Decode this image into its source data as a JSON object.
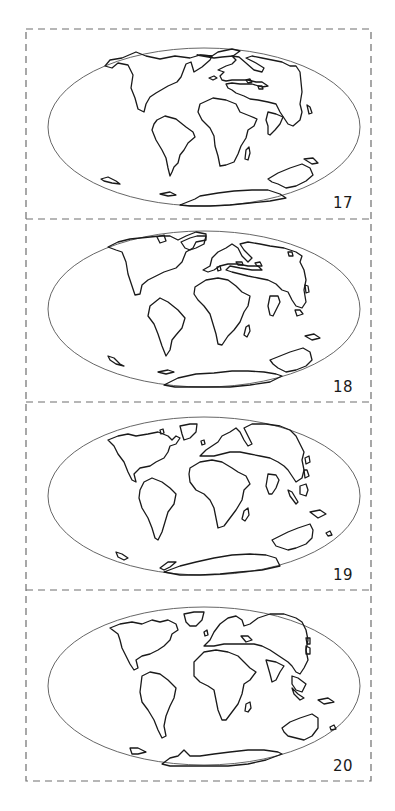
{
  "figure": {
    "stroke_color": "#1a1a1a",
    "frame_color": "#6e6e6e",
    "ellipse_color": "#555555",
    "frame": {
      "x": 26,
      "y": 29,
      "w": 345,
      "h": 752
    },
    "dividers_y": [
      219,
      402,
      590
    ]
  },
  "panels": [
    {
      "label": "17",
      "label_pos": {
        "x": 333,
        "y": 196
      },
      "ellipse": {
        "cx": 204,
        "cy": 127,
        "rx": 156,
        "ry": 79
      },
      "dy": 0,
      "continents": [
        {
          "name": "north-america",
          "d": "M105,66 L112,68 L118,63 L128,65 L133,75 L131,88 L135,98 L138,109 L144,112 L146,104 L150,97 L156,93 L168,86 L177,82 L181,77 L186,64 L191,62 L194,72 L202,67 L210,60 L212,56 L200,55 L190,58 L175,56 L160,59 L146,56 L136,52 L122,58 L110,60 Z"
        },
        {
          "name": "greenland",
          "d": "M197,55 L212,56 L218,52 L232,49 L240,51 L233,56 L222,57 L214,58 Z"
        },
        {
          "name": "south-america",
          "d": "M157,120 L165,116 L176,119 L186,127 L193,132 L195,137 L188,143 L184,150 L180,155 L178,163 L174,167 L172,172 L170,176 L168,168 L166,158 L162,150 L156,140 L152,130 L154,124 Z"
        },
        {
          "name": "africa",
          "d": "M200,104 L213,98 L226,100 L236,104 L240,112 L250,116 L257,119 L254,126 L248,130 L246,138 L241,146 L238,154 L234,162 L226,165 L220,166 L218,156 L215,146 L214,136 L210,128 L206,124 L202,120 L198,112 Z"
        },
        {
          "name": "madagascar",
          "d": "M246,150 L249,147 L250,153 L248,160 L245,159 Z"
        },
        {
          "name": "eurasia",
          "d": "M218,70 L226,66 L232,64 L236,60 L232,56 L239,57 L246,63 L254,70 L262,72 L264,68 L256,63 L246,58 L252,56 L262,58 L272,60 L282,62 L290,66 L296,66 L300,72 L301,82 L302,92 L300,104 L302,112 L300,120 L293,126 L288,124 L284,118 L280,112 L276,104 L268,102 L258,100 L250,99 L244,96 L236,93 L232,90 L228,88 L226,84 L232,83 L240,84 L252,84 L262,87 L268,86 L262,82 L256,82 L248,80 L240,80 L232,80 L226,81 L222,80 L220,76 L224,72 Z"
        },
        {
          "name": "india",
          "d": "M268,112 L276,114 L283,117 L280,124 L275,130 L270,135 L268,134 L268,126 L266,120 Z"
        },
        {
          "name": "small-island-1",
          "d": "M246,80 L250,79 L252,82 L248,83 Z"
        },
        {
          "name": "small-island-2",
          "d": "M258,86 L262,86 L263,89 L259,89 Z"
        },
        {
          "name": "small-island-3",
          "d": "M209,78 L214,76 L217,78 L213,80 Z"
        },
        {
          "name": "japan",
          "d": "M307,105 L310,107 L312,113 L309,114 Z"
        },
        {
          "name": "australia",
          "d": "M268,179 L278,173 L290,168 L302,164 L310,168 L313,175 L306,181 L296,186 L286,188 L278,184 L272,182 Z"
        },
        {
          "name": "new-zealand",
          "d": "M304,159 L313,158 L318,163 L312,164 Z"
        },
        {
          "name": "antarctic-piece-1",
          "d": "M101,179 L108,177 L116,181 L120,184 L112,183 L104,181 Z"
        },
        {
          "name": "antarctic-piece-2",
          "d": "M160,194 L170,192 L176,195 L168,196 Z"
        },
        {
          "name": "antarctica",
          "d": "M180,205 L195,199 L200,196 L218,193 L234,191 L252,190 L268,190 L280,194 L286,198 L270,201 L250,203 L230,205 L210,206 L190,206 Z"
        }
      ]
    },
    {
      "label": "18",
      "label_pos": {
        "x": 333,
        "y": 380
      },
      "ellipse": {
        "cx": 204,
        "cy": 309,
        "rx": 156,
        "ry": 78
      },
      "dy": 0,
      "continents": [
        {
          "name": "north-america",
          "d": "M108,247 L116,250 L122,252 L126,262 L128,274 L131,283 L135,295 L140,294 L142,285 L148,280 L156,276 L164,272 L176,268 L182,262 L186,252 L193,248 L196,242 L206,240 L206,234 L196,232 L186,236 L178,240 L170,236 L160,236 L150,237 L140,238 L130,239 L118,242 Z"
        },
        {
          "name": "greenland",
          "d": "M181,242 L190,238 L197,236 L206,236 L204,244 L196,248 L190,250 L185,248 Z"
        },
        {
          "name": "greenland-ice",
          "d": "M157,237 L164,235 L166,241 L160,243 Z"
        },
        {
          "name": "south-america",
          "d": "M150,306 L160,298 L168,302 L178,310 L185,318 L182,328 L176,335 L172,340 L170,350 L166,356 L162,346 L158,334 L154,324 L148,316 Z"
        },
        {
          "name": "africa",
          "d": "M195,287 L206,280 L218,278 L228,280 L236,286 L242,292 L250,296 L248,306 L244,312 L240,322 L234,330 L228,336 L222,345 L218,344 L216,334 L213,324 L210,314 L204,306 L198,300 L194,294 Z"
        },
        {
          "name": "madagascar",
          "d": "M246,327 L249,325 L250,331 L247,337 L244,335 Z"
        },
        {
          "name": "eurasia",
          "d": "M203,270 L210,266 L212,258 L218,252 L226,248 L232,244 L238,248 L242,256 L248,262 L252,258 L244,250 L240,244 L248,242 L260,244 L270,246 L284,248 L296,252 L302,256 L300,262 L304,270 L306,280 L304,290 L306,302 L302,308 L296,306 L292,300 L288,292 L282,290 L276,284 L268,280 L258,278 L248,276 L240,274 L232,272 L226,270 L230,266 L240,268 L252,270 L262,270 L258,266 L248,266 L238,264 L228,264 L220,266 L214,270 L208,272 Z"
        },
        {
          "name": "india",
          "d": "M270,296 L278,296 L280,302 L276,310 L273,316 L270,315 L268,306 Z"
        },
        {
          "name": "japan",
          "d": "M305,285 L308,286 L309,292 L306,293 Z"
        },
        {
          "name": "se-asia-island",
          "d": "M295,310 L300,310 L303,314 L297,316 Z"
        },
        {
          "name": "small-island-1",
          "d": "M217,267 L220,266 L221,270 L218,271 Z"
        },
        {
          "name": "small-island-2",
          "d": "M255,263 L260,262 L262,266 L257,266 Z"
        },
        {
          "name": "small-island-3",
          "d": "M236,262 L242,262 L243,265 L238,265 Z"
        },
        {
          "name": "kamchatka",
          "d": "M288,252 L292,252 L293,256 L289,256 Z"
        },
        {
          "name": "australia",
          "d": "M270,360 L280,356 L290,352 L303,348 L310,352 L312,360 L306,366 L296,370 L286,372 L278,368 L273,364 Z"
        },
        {
          "name": "new-zealand",
          "d": "M305,336 L314,334 L320,338 L312,340 Z"
        },
        {
          "name": "antarctic-piece-1",
          "d": "M108,356 L114,358 L120,364 L124,366 L116,364 L110,360 Z"
        },
        {
          "name": "antarctic-piece-2",
          "d": "M158,372 L168,370 L174,372 L166,374 Z"
        },
        {
          "name": "antarctica",
          "d": "M164,385 L178,378 L196,374 L214,373 L232,371 L248,371 L264,372 L276,374 L282,376 L270,382 L250,385 L230,387 L210,387 L190,387 L175,387 Z"
        }
      ]
    },
    {
      "label": "19",
      "label_pos": {
        "x": 333,
        "y": 568
      },
      "ellipse": {
        "cx": 204,
        "cy": 496,
        "rx": 156,
        "ry": 79
      },
      "dy": 0,
      "continents": [
        {
          "name": "north-america",
          "d": "M108,440 L118,436 L128,434 L136,436 L148,434 L158,432 L168,436 L172,440 L176,436 L180,438 L176,444 L170,446 L168,452 L164,458 L156,462 L150,466 L140,468 L134,474 L136,482 L132,480 L128,472 L124,462 L118,454 L114,446 Z"
        },
        {
          "name": "greenland",
          "d": "M180,426 L190,424 L197,424 L196,432 L190,438 L184,440 L182,434 Z"
        },
        {
          "name": "south-america",
          "d": "M144,482 L152,478 L162,482 L170,488 L176,494 L174,504 L168,512 L165,522 L162,532 L158,540 L155,538 L152,528 L148,518 L142,508 L139,498 L140,490 Z"
        },
        {
          "name": "africa",
          "d": "M190,468 L200,462 L212,460 L222,462 L232,468 L238,472 L246,476 L250,484 L244,490 L242,500 L236,510 L230,518 L224,526 L218,528 L216,518 L214,508 L210,500 L204,494 L196,490 L190,482 L189,474 Z"
        },
        {
          "name": "madagascar",
          "d": "M244,511 L248,508 L249,515 L245,521 L242,519 Z"
        },
        {
          "name": "eurasia",
          "d": "M200,456 L206,450 L212,446 L218,442 L222,436 L230,432 L236,428 L240,432 L244,440 L248,446 L252,444 L248,436 L244,428 L252,424 L266,424 L280,426 L290,430 L296,436 L300,444 L304,452 L302,460 L304,470 L302,478 L296,482 L292,476 L288,470 L284,466 L278,462 L270,458 L260,456 L250,454 L240,452 L230,452 L222,454 L214,456 Z"
        },
        {
          "name": "india",
          "d": "M268,474 L276,475 L279,480 L276,488 L272,494 L269,494 L266,486 Z"
        },
        {
          "name": "sumatra",
          "d": "M288,490 L292,492 L298,502 L296,504 L290,496 Z"
        },
        {
          "name": "borneo",
          "d": "M300,486 L306,484 L308,490 L306,496 L300,494 Z"
        },
        {
          "name": "japan",
          "d": "M304,470 L307,470 L309,476 L305,478 Z"
        },
        {
          "name": "kuril",
          "d": "M305,458 L309,456 L310,462 L306,464 Z"
        },
        {
          "name": "small-island-1",
          "d": "M201,441 L204,440 L205,444 L202,445 Z"
        },
        {
          "name": "small-island-2",
          "d": "M160,430 L163,429 L164,433 L161,434 Z"
        },
        {
          "name": "australia",
          "d": "M272,540 L280,536 L288,532 L298,528 L310,524 L313,530 L312,538 L306,544 L296,548 L288,550 L282,548 L276,546 Z"
        },
        {
          "name": "new-zealand",
          "d": "M310,512 L320,510 L326,514 L318,518 Z"
        },
        {
          "name": "pacific-island",
          "d": "M326,533 L330,531 L332,535 L328,536 Z"
        },
        {
          "name": "antarctic-piece-1",
          "d": "M116,552 L122,554 L128,558 L124,560 L118,557 Z"
        },
        {
          "name": "antarctic-piece-2",
          "d": "M160,568 L168,562 L176,562 L170,567 L164,570 Z"
        },
        {
          "name": "antarctica",
          "d": "M164,572 L180,566 L196,562 L214,558 L232,555 L250,554 L266,555 L276,558 L280,566 L262,570 L240,572 L220,574 L200,575 L180,575 Z"
        }
      ]
    },
    {
      "label": "20",
      "label_pos": {
        "x": 333,
        "y": 759
      },
      "ellipse": {
        "cx": 204,
        "cy": 686,
        "rx": 156,
        "ry": 79
      },
      "dy": 0,
      "continents": [
        {
          "name": "north-america",
          "d": "M110,628 L120,624 L132,622 L142,624 L152,620 L160,622 L168,620 L176,624 L178,630 L172,634 L170,640 L164,646 L158,650 L150,654 L142,656 L136,660 L138,668 L134,670 L130,664 L126,656 L122,648 L120,640 L118,634 Z"
        },
        {
          "name": "greenland",
          "d": "M184,614 L194,612 L204,612 L202,620 L196,626 L190,626 L186,622 Z"
        },
        {
          "name": "south-america",
          "d": "M142,676 L150,672 L160,674 L168,680 L176,688 L174,698 L170,706 L166,716 L164,726 L166,736 L162,738 L158,730 L154,720 L148,710 L142,702 L140,692 Z"
        },
        {
          "name": "africa",
          "d": "M194,662 L204,652 L216,650 L228,652 L238,656 L244,662 L250,668 L256,672 L250,680 L244,684 L242,694 L238,704 L232,712 L226,720 L222,720 L218,710 L216,700 L214,690 L208,686 L200,682 L194,676 Z"
        },
        {
          "name": "madagascar",
          "d": "M246,704 L250,702 L251,708 L248,712 L245,711 Z"
        },
        {
          "name": "eurasia",
          "d": "M204,646 L210,640 L214,632 L220,624 L228,618 L236,616 L242,620 L244,626 L250,624 L258,618 L270,614 L284,614 L296,618 L302,622 L306,630 L308,640 L306,650 L308,660 L304,668 L300,674 L296,672 L292,666 L288,662 L282,658 L276,654 L270,650 L262,646 L254,644 L244,644 L234,644 L224,644 L214,646 Z"
        },
        {
          "name": "arabia",
          "d": "M266,660 L276,662 L284,666 L280,672 L276,680 L272,682 L270,674 Z"
        },
        {
          "name": "se-asia",
          "d": "M292,676 L298,678 L306,684 L302,692 L296,690 L292,684 Z"
        },
        {
          "name": "sumatra",
          "d": "M292,688 L298,694 L304,698 L300,700 L294,694 Z"
        },
        {
          "name": "japan",
          "d": "M306,646 L310,648 L310,654 L306,654 Z"
        },
        {
          "name": "kuril",
          "d": "M306,638 L310,638 L310,644 L307,644 Z"
        },
        {
          "name": "small-island-1",
          "d": "M204,632 L207,630 L208,635 L205,636 Z"
        },
        {
          "name": "small-island-2",
          "d": "M241,636 L248,636 L252,640 L246,642 Z"
        },
        {
          "name": "australia",
          "d": "M282,728 L290,722 L300,718 L312,714 L318,718 L318,728 L312,736 L304,740 L296,738 L288,736 L284,732 Z"
        },
        {
          "name": "new-zealand",
          "d": "M318,700 L328,698 L334,702 L324,704 Z"
        },
        {
          "name": "pacific-island",
          "d": "M330,727 L334,725 L336,729 L331,730 Z"
        },
        {
          "name": "antarctic-piece-1",
          "d": "M130,748 L138,748 L146,752 L138,754 L132,754 Z"
        },
        {
          "name": "antarctica",
          "d": "M162,764 L170,758 L178,756 L184,750 L190,756 L200,756 L214,754 L230,752 L248,750 L264,750 L278,752 L282,754 L266,760 L248,764 L228,766 L208,766 L186,766 L170,766 Z"
        }
      ]
    }
  ]
}
